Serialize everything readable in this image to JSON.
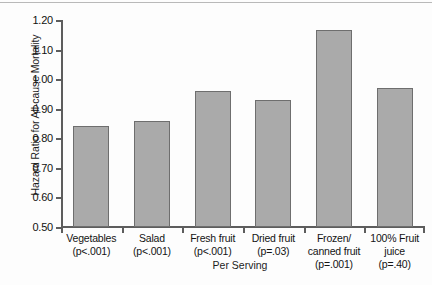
{
  "chart_data": {
    "type": "bar",
    "title": "",
    "xlabel": "Per Serving",
    "ylabel": "Hazard Ratio for All-cause Mortality",
    "ylim": [
      0.5,
      1.2
    ],
    "ytick_labels": [
      "1.20",
      "1.10",
      "1.00",
      "0.90",
      "0.80",
      "0.70",
      "0.60",
      "0.50"
    ],
    "ytick_values": [
      1.2,
      1.1,
      1.0,
      0.9,
      0.8,
      0.7,
      0.6,
      0.5
    ],
    "grid": false,
    "legend": "none",
    "categories": [
      "Vegetables",
      "Salad",
      "Fresh fruit",
      "Dried fruit",
      "Frozen/\ncanned fruit",
      "100% Fruit\njuice"
    ],
    "annotations": [
      "(p<.001)",
      "(p<.001)",
      "(p<.001)",
      "(p=.03)",
      "(p=.001)",
      "(p=.40)"
    ],
    "values": [
      0.84,
      0.86,
      0.96,
      0.93,
      1.165,
      0.97
    ],
    "bar_color": "#aaaaaa",
    "bar_edge_color": "#6e6e6e",
    "axis_color": "#5d5d5d"
  }
}
